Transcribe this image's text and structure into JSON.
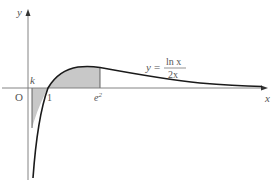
{
  "diagram": {
    "type": "function-graph",
    "function_label": {
      "lhs": "y",
      "eq": "=",
      "numerator": "ln x",
      "denominator": "2x"
    },
    "axes": {
      "x_label": "x",
      "y_label": "y",
      "origin_label": "O"
    },
    "points": {
      "k_label": "k",
      "one_label": "1",
      "e2_label": "e",
      "e2_exp": "2"
    },
    "shaded_regions": [
      {
        "from": "k",
        "to": "1",
        "side": "below x-axis"
      },
      {
        "from": "1",
        "to": "e²",
        "side": "above x-axis"
      }
    ],
    "colors": {
      "curve": "#1a1a1a",
      "axis": "#777777",
      "shade": "#c8c8c8",
      "text": "#555555"
    }
  }
}
